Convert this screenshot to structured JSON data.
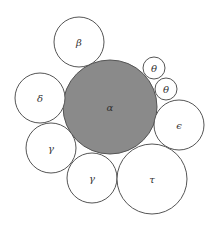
{
  "diagram": {
    "type": "circle-packing",
    "background": "#ffffff",
    "stroke_color": "#555555",
    "highlight_fill": "#8a8a8a",
    "circles": [
      {
        "id": "alpha",
        "label": "α",
        "cx": 110,
        "cy": 107,
        "r": 47,
        "filled": true
      },
      {
        "id": "beta",
        "label": "β",
        "cx": 79,
        "cy": 42,
        "r": 25,
        "filled": false
      },
      {
        "id": "theta-1",
        "label": "θ",
        "cx": 154,
        "cy": 68,
        "r": 11,
        "filled": false
      },
      {
        "id": "theta-2",
        "label": "θ",
        "cx": 166,
        "cy": 89,
        "r": 11,
        "filled": false
      },
      {
        "id": "delta",
        "label": "δ",
        "cx": 40,
        "cy": 98,
        "r": 25,
        "filled": false
      },
      {
        "id": "epsilon",
        "label": "ϵ",
        "cx": 179,
        "cy": 125,
        "r": 25,
        "filled": false
      },
      {
        "id": "gamma-1",
        "label": "γ",
        "cx": 51,
        "cy": 148,
        "r": 25,
        "filled": false
      },
      {
        "id": "gamma-2",
        "label": "γ",
        "cx": 92,
        "cy": 178,
        "r": 25,
        "filled": false
      },
      {
        "id": "tau",
        "label": "τ",
        "cx": 152,
        "cy": 179,
        "r": 35,
        "filled": false
      }
    ]
  }
}
